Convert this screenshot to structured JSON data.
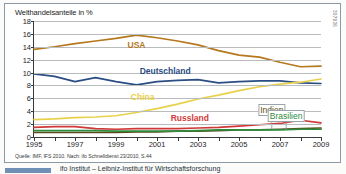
{
  "figure": {
    "title": "Welthandelsanteile in %",
    "source": "Quelle: IMF, IFS 2010. Nach: ifo Schnelldienst 23/2010, S.44",
    "id_code": "307936"
  },
  "colors": {
    "usa": "#b5781e",
    "deutschland": "#2a4d83",
    "china": "#e8d14a",
    "russland": "#cf3a38",
    "indien": "#5a4a17",
    "brasilien": "#2e8b3d",
    "grid": "#b9bcbe",
    "axis": "#3a3a3a",
    "panel_border": "#8d9aa5"
  },
  "chart_data": {
    "type": "line",
    "title": "Welthandelsanteile in %",
    "xlabel": "",
    "ylabel": "",
    "xlim": [
      1995,
      2009
    ],
    "ylim": [
      0,
      18
    ],
    "ytick_step": 2,
    "grid": true,
    "legend_position": "inline-labels",
    "x": [
      1995,
      1996,
      1997,
      1998,
      1999,
      2000,
      2001,
      2002,
      2003,
      2004,
      2005,
      2006,
      2007,
      2008,
      2009
    ],
    "ytick_labels": [
      "0",
      "2",
      "4",
      "6",
      "8",
      "10",
      "12",
      "14",
      "16",
      "18"
    ],
    "xtick_labels": [
      "1995",
      "1997",
      "1999",
      "2001",
      "2003",
      "2005",
      "2007",
      "2009"
    ],
    "series": [
      {
        "name": "USA",
        "color": "#b5781e",
        "values": [
          13.6,
          14.0,
          14.5,
          14.9,
          15.3,
          15.8,
          15.4,
          14.9,
          14.3,
          13.4,
          12.7,
          12.4,
          11.6,
          10.9,
          11.0
        ],
        "label_x": 2000.0,
        "label_y": 14.3
      },
      {
        "name": "Deutschland",
        "color": "#2a4d83",
        "values": [
          9.8,
          9.4,
          8.6,
          9.2,
          8.6,
          8.1,
          8.6,
          8.8,
          8.9,
          8.4,
          8.6,
          8.7,
          8.7,
          8.4,
          8.3
        ],
        "label_x": 2001.4,
        "label_y": 10.2
      },
      {
        "name": "China",
        "color": "#e8d14a",
        "values": [
          2.7,
          2.8,
          3.0,
          3.1,
          3.3,
          3.8,
          4.4,
          5.1,
          5.9,
          6.5,
          7.2,
          7.8,
          8.2,
          8.5,
          9.0
        ],
        "label_x": 2000.3,
        "label_y": 6.2
      },
      {
        "name": "Russland",
        "color": "#cf3a38",
        "values": [
          1.5,
          1.6,
          1.6,
          1.3,
          1.2,
          1.3,
          1.3,
          1.3,
          1.4,
          1.5,
          1.7,
          1.9,
          2.1,
          2.6,
          2.2
        ],
        "label_x": 2002.6,
        "label_y": 2.9
      },
      {
        "name": "Indien",
        "color": "#5a4a17",
        "values": [
          0.7,
          0.7,
          0.7,
          0.7,
          0.7,
          0.8,
          0.8,
          0.9,
          0.9,
          1.0,
          1.1,
          1.1,
          1.2,
          1.3,
          1.4
        ],
        "label_x": 2006.6,
        "label_y": 4.2
      },
      {
        "name": "Brasilien",
        "color": "#2e8b3d",
        "values": [
          1.0,
          1.0,
          1.0,
          1.0,
          0.9,
          0.9,
          0.9,
          0.9,
          1.0,
          1.1,
          1.1,
          1.1,
          1.1,
          1.2,
          1.2
        ],
        "label_x": 2007.3,
        "label_y": 3.3
      }
    ]
  },
  "bottom_strip": {
    "text": "ifo Institut – Leibniz-Institut für Wirtschaftsforschung"
  }
}
